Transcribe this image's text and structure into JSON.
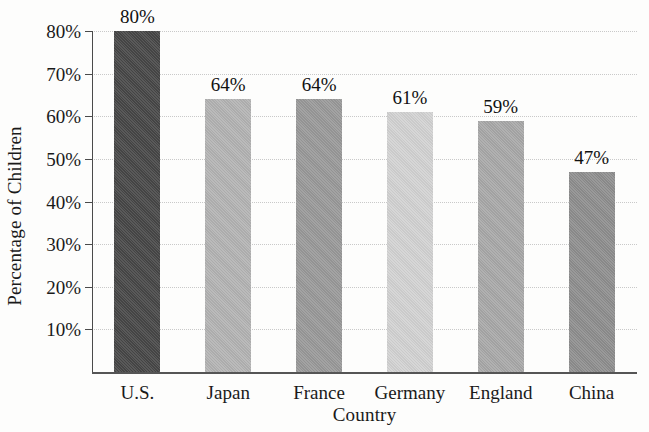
{
  "chart_data": {
    "type": "bar",
    "title": "",
    "subtitle": "",
    "xlabel": "Country",
    "ylabel": "Percentage of Children",
    "categories": [
      "U.S.",
      "Japan",
      "France",
      "Germany",
      "England",
      "China"
    ],
    "values": [
      80,
      64,
      64,
      61,
      59,
      47
    ],
    "value_labels": [
      "80%",
      "64%",
      "64%",
      "61%",
      "59%",
      "47%"
    ],
    "ytick_labels": [
      "10%",
      "20%",
      "30%",
      "40%",
      "50%",
      "60%",
      "70%",
      "80%"
    ],
    "ytick_values": [
      10,
      20,
      30,
      40,
      50,
      60,
      70,
      80
    ],
    "ylim": [
      0,
      80
    ],
    "xlim_note": "categorical",
    "grid": "horizontal-dotted",
    "legend": "none",
    "bar_colors": [
      "#474747",
      "#b3b3b3",
      "#999999",
      "#d2d2d2",
      "#a8a8a8",
      "#8e8e8e"
    ],
    "axis_color": "#4a4a4a",
    "gridline_color": "#c9c9c9",
    "background_color": "#fdfdfc"
  }
}
